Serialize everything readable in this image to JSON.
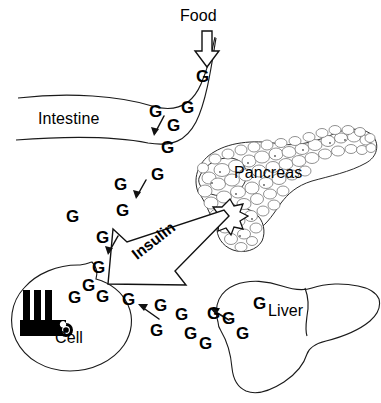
{
  "figure": {
    "background_color": "#ffffff",
    "line_color": "#111111",
    "width": 381,
    "height": 403
  },
  "labels": {
    "food": "Food",
    "intestine": "Intestine",
    "pancreas": "Pancreas",
    "insulin": "Insulin",
    "liver": "Liver",
    "cell": "Cell"
  },
  "glucose": {
    "symbol": "G",
    "count": 24,
    "markers": [
      {
        "id": "g01",
        "text": "G",
        "x": 196,
        "y": 68,
        "size": 17
      },
      {
        "id": "g02",
        "text": "G",
        "x": 181,
        "y": 99,
        "size": 17
      },
      {
        "id": "g03",
        "text": "G",
        "x": 149,
        "y": 103,
        "size": 17
      },
      {
        "id": "g04",
        "text": "G",
        "x": 167,
        "y": 117,
        "size": 17
      },
      {
        "id": "g05",
        "text": "G",
        "x": 161,
        "y": 139,
        "size": 17
      },
      {
        "id": "g06",
        "text": "G",
        "x": 151,
        "y": 166,
        "size": 17
      },
      {
        "id": "g07",
        "text": "G",
        "x": 114,
        "y": 176,
        "size": 17
      },
      {
        "id": "g08",
        "text": "G",
        "x": 116,
        "y": 202,
        "size": 17
      },
      {
        "id": "g09",
        "text": "G",
        "x": 66,
        "y": 208,
        "size": 17
      },
      {
        "id": "g10",
        "text": "G",
        "x": 96,
        "y": 229,
        "size": 17
      },
      {
        "id": "g11",
        "text": "G",
        "x": 92,
        "y": 259,
        "size": 17
      },
      {
        "id": "g12",
        "text": "G",
        "x": 82,
        "y": 277,
        "size": 17
      },
      {
        "id": "g13",
        "text": "G",
        "x": 96,
        "y": 288,
        "size": 17
      },
      {
        "id": "g14",
        "text": "G",
        "x": 68,
        "y": 289,
        "size": 17
      },
      {
        "id": "g15",
        "text": "G",
        "x": 122,
        "y": 291,
        "size": 17
      },
      {
        "id": "g16",
        "text": "G",
        "x": 154,
        "y": 297,
        "size": 17
      },
      {
        "id": "g17",
        "text": "G",
        "x": 150,
        "y": 322,
        "size": 17
      },
      {
        "id": "g18",
        "text": "G",
        "x": 175,
        "y": 306,
        "size": 17
      },
      {
        "id": "g19",
        "text": "G",
        "x": 184,
        "y": 325,
        "size": 17
      },
      {
        "id": "g20",
        "text": "G",
        "x": 199,
        "y": 335,
        "size": 17
      },
      {
        "id": "g21",
        "text": "G",
        "x": 207,
        "y": 305,
        "size": 17
      },
      {
        "id": "g22",
        "text": "G",
        "x": 222,
        "y": 310,
        "size": 17
      },
      {
        "id": "g23",
        "text": "G",
        "x": 253,
        "y": 295,
        "size": 17
      },
      {
        "id": "g24",
        "text": "G",
        "x": 236,
        "y": 325,
        "size": 17
      }
    ]
  },
  "flow_arrows": {
    "food_arrow": {
      "direction": "down",
      "from": "Food",
      "to": "Intestine"
    },
    "insulin_arrow": {
      "direction": "down-left",
      "from": "Pancreas",
      "to": "Cell"
    },
    "glucose_arrows": [
      {
        "id": "ga1",
        "direction": "down-left",
        "near": "Intestine"
      },
      {
        "id": "ga2",
        "direction": "down-left",
        "near": "glucose trail"
      },
      {
        "id": "ga3",
        "direction": "down-left",
        "near": "glucose trail"
      },
      {
        "id": "ga4",
        "direction": "up-left",
        "near": "Cell"
      },
      {
        "id": "ga5",
        "direction": "up-left",
        "near": "Liver"
      }
    ]
  }
}
